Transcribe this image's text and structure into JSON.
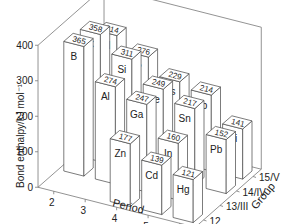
{
  "chart_data": {
    "type": "bar",
    "subtype": "3d-bar",
    "title": "",
    "ylabel": "Bond enthalpy/kJ mol⁻¹",
    "xlabel": "Period",
    "zlabel": "Group",
    "ylim": [
      0,
      400
    ],
    "yticks": [
      "0",
      "100",
      "200",
      "300",
      "400"
    ],
    "periods": [
      "2",
      "3",
      "4",
      "5",
      "6"
    ],
    "groups": [
      "12",
      "13/III",
      "14/IV",
      "15/V"
    ],
    "bars": [
      {
        "element": "B",
        "period": "2",
        "group": "13/III",
        "value": 365
      },
      {
        "element": "C",
        "period": "2",
        "group": "14/IV",
        "value": 358
      },
      {
        "element": "N",
        "period": "2",
        "group": "15/V",
        "value": 314
      },
      {
        "element": "Al",
        "period": "3",
        "group": "13/III",
        "value": 274
      },
      {
        "element": "Si",
        "period": "3",
        "group": "14/IV",
        "value": 311
      },
      {
        "element": "P",
        "period": "3",
        "group": "15/V",
        "value": 276
      },
      {
        "element": "Zn",
        "period": "4",
        "group": "12",
        "value": 177
      },
      {
        "element": "Ga",
        "period": "4",
        "group": "13/III",
        "value": 247
      },
      {
        "element": "Ge",
        "period": "4",
        "group": "14/IV",
        "value": 249
      },
      {
        "element": "As",
        "period": "4",
        "group": "15/V",
        "value": 229
      },
      {
        "element": "Cd",
        "period": "5",
        "group": "12",
        "value": 139
      },
      {
        "element": "In",
        "period": "5",
        "group": "13/III",
        "value": 160
      },
      {
        "element": "Sn",
        "period": "5",
        "group": "14/IV",
        "value": 217
      },
      {
        "element": "Sb",
        "period": "5",
        "group": "15/V",
        "value": 214
      },
      {
        "element": "Hg",
        "period": "6",
        "group": "12",
        "value": 121
      },
      {
        "element": "Pb",
        "period": "6",
        "group": "14/IV",
        "value": 152
      },
      {
        "element": "Bi",
        "period": "6",
        "group": "15/V",
        "value": 141
      }
    ],
    "grid": false,
    "legend": "none"
  },
  "colors": {
    "bar_face": "#ffffff",
    "bar_edge": "#444444",
    "axis": "#777777",
    "text": "#222222"
  }
}
